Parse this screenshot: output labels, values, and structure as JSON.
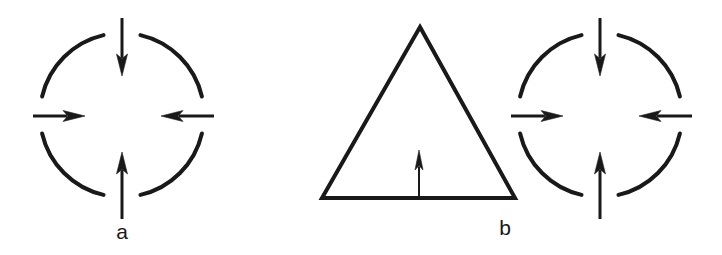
{
  "figure": {
    "background_color": "#ffffff",
    "stroke_color": "#191919",
    "width": 722,
    "height": 255,
    "panels": [
      {
        "id": "panel-a",
        "label": "a",
        "label_position": {
          "x": 122,
          "y": 232
        },
        "shapes": [
          {
            "kind": "broken-circle",
            "name": "circle-a",
            "center": {
              "x": 122,
              "y": 115
            },
            "radius": 82,
            "stroke_width": 4,
            "gap_degrees": 13,
            "arc_gaps_at": [
              "top",
              "right",
              "bottom",
              "left"
            ]
          }
        ],
        "arrows": [
          {
            "name": "arrow-top",
            "direction": "down",
            "from": {
              "x": 122,
              "y": 18
            },
            "to": {
              "x": 122,
              "y": 76
            },
            "shaft_width": 3,
            "head_length": 22,
            "head_width": 11
          },
          {
            "name": "arrow-left",
            "direction": "right",
            "from": {
              "x": 33,
              "y": 116
            },
            "to": {
              "x": 85,
              "y": 116
            },
            "shaft_width": 3,
            "head_length": 22,
            "head_width": 11
          },
          {
            "name": "arrow-right",
            "direction": "left",
            "from": {
              "x": 214,
              "y": 116
            },
            "to": {
              "x": 161,
              "y": 116
            },
            "shaft_width": 3,
            "head_length": 22,
            "head_width": 11
          },
          {
            "name": "arrow-bottom",
            "direction": "up",
            "from": {
              "x": 122,
              "y": 219
            },
            "to": {
              "x": 122,
              "y": 152
            },
            "shaft_width": 3,
            "head_length": 22,
            "head_width": 11
          }
        ]
      },
      {
        "id": "panel-b",
        "label": "b",
        "label_position": {
          "x": 505,
          "y": 228
        },
        "shapes": [
          {
            "kind": "triangle",
            "name": "triangle-b",
            "apex": {
              "x": 420,
              "y": 27
            },
            "base_left": {
              "x": 322,
              "y": 198
            },
            "base_right": {
              "x": 515,
              "y": 198
            },
            "stroke_width": 4
          },
          {
            "kind": "broken-circle",
            "name": "circle-b",
            "center": {
              "x": 600,
              "y": 115
            },
            "radius": 82,
            "stroke_width": 4,
            "gap_degrees": 13,
            "arc_gaps_at": [
              "top",
              "right",
              "bottom",
              "left"
            ]
          }
        ],
        "arrows": [
          {
            "name": "arrow-triangle-up",
            "direction": "up",
            "from": {
              "x": 419,
              "y": 198
            },
            "to": {
              "x": 419,
              "y": 150
            },
            "shaft_width": 2,
            "head_length": 20,
            "head_width": 8
          },
          {
            "name": "arrow-top",
            "direction": "down",
            "from": {
              "x": 600,
              "y": 18
            },
            "to": {
              "x": 600,
              "y": 76
            },
            "shaft_width": 3,
            "head_length": 22,
            "head_width": 11
          },
          {
            "name": "arrow-left",
            "direction": "right",
            "from": {
              "x": 511,
              "y": 116
            },
            "to": {
              "x": 563,
              "y": 116
            },
            "shaft_width": 3,
            "head_length": 22,
            "head_width": 11
          },
          {
            "name": "arrow-right",
            "direction": "left",
            "from": {
              "x": 692,
              "y": 116
            },
            "to": {
              "x": 639,
              "y": 116
            },
            "shaft_width": 3,
            "head_length": 22,
            "head_width": 11
          },
          {
            "name": "arrow-bottom",
            "direction": "up",
            "from": {
              "x": 600,
              "y": 219
            },
            "to": {
              "x": 600,
              "y": 152
            },
            "shaft_width": 3,
            "head_length": 22,
            "head_width": 11
          }
        ]
      }
    ]
  }
}
